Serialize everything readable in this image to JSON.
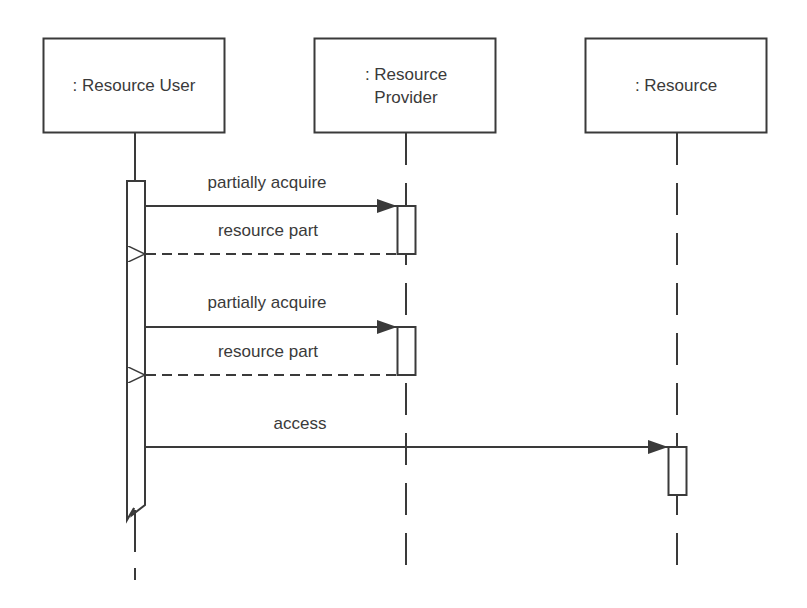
{
  "diagram": {
    "type": "uml-sequence",
    "colors": {
      "line": "#3a3a3a",
      "text": "#3a3a3a",
      "background": "#ffffff"
    },
    "lifelines": [
      {
        "id": "user",
        "label_lines": [
          ": Resource User"
        ]
      },
      {
        "id": "provider",
        "label_lines": [
          ": Resource",
          "Provider"
        ]
      },
      {
        "id": "resource",
        "label_lines": [
          ": Resource"
        ]
      }
    ],
    "messages": [
      {
        "from": "user",
        "to": "provider",
        "kind": "synchronous",
        "label": "partially acquire"
      },
      {
        "from": "provider",
        "to": "user",
        "kind": "reply",
        "label": "resource part"
      },
      {
        "from": "user",
        "to": "provider",
        "kind": "synchronous",
        "label": "partially acquire"
      },
      {
        "from": "provider",
        "to": "user",
        "kind": "reply",
        "label": "resource part"
      },
      {
        "from": "user",
        "to": "resource",
        "kind": "synchronous",
        "label": "access"
      }
    ]
  }
}
